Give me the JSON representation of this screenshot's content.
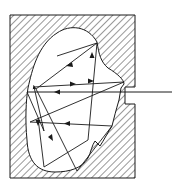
{
  "diagram": {
    "type": "cavity-multiple-reflection",
    "colors": {
      "line": "#1a1a1a",
      "hatch": "#333333",
      "background": "#ffffff"
    },
    "block": {
      "x": 10,
      "y": 15,
      "width": 125,
      "height": 163
    },
    "slot": {
      "y_top": 87,
      "y_bottom": 104,
      "inner_x": 125
    },
    "incoming_ray": {
      "from": [
        172,
        92
      ],
      "to": [
        27,
        92
      ]
    },
    "rays": [
      [
        [
          27,
          92
        ],
        [
          44,
          131
        ]
      ],
      [
        [
          44,
          131
        ],
        [
          34,
          87
        ]
      ],
      [
        [
          34,
          87
        ],
        [
          124,
          82
        ]
      ],
      [
        [
          124,
          82
        ],
        [
          30,
          122
        ]
      ],
      [
        [
          30,
          122
        ],
        [
          112,
          126
        ]
      ],
      [
        [
          112,
          126
        ],
        [
          77,
          171
        ]
      ],
      [
        [
          77,
          171
        ],
        [
          36,
          89
        ]
      ],
      [
        [
          36,
          89
        ],
        [
          57,
          56
        ]
      ],
      [
        [
          57,
          56
        ],
        [
          97,
          43
        ]
      ],
      [
        [
          97,
          43
        ],
        [
          88,
          140
        ]
      ],
      [
        [
          88,
          140
        ],
        [
          44,
          167
        ]
      ],
      [
        [
          44,
          167
        ],
        [
          38,
          118
        ]
      ]
    ],
    "arrows": [
      {
        "at": [
          58,
          92
        ],
        "dir": "left"
      },
      {
        "at": [
          70,
          67
        ],
        "dir": "up-left"
      },
      {
        "at": [
          72,
          84
        ],
        "dir": "right"
      },
      {
        "at": [
          90,
          81
        ],
        "dir": "right"
      },
      {
        "at": [
          68,
          123
        ],
        "dir": "left"
      },
      {
        "at": [
          92,
          55
        ],
        "dir": "up"
      },
      {
        "at": [
          38,
          120
        ],
        "dir": "down"
      },
      {
        "at": [
          50,
          138
        ],
        "dir": "down-right"
      }
    ]
  }
}
